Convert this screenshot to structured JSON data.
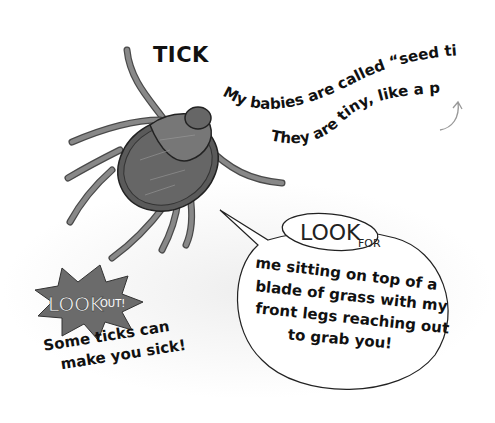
{
  "title": "TICK",
  "fact": {
    "line1": "My babies are called “seed ticks.”",
    "line2": "They are tiny, like a period."
  },
  "look_for": {
    "badge_look": "LOOK",
    "badge_for": "FOR",
    "lines": [
      "me sitting on top of a",
      "blade of grass with my",
      "front legs reaching out",
      "to grab you!"
    ]
  },
  "look_out": {
    "badge_look": "LOOK",
    "badge_out": "OUT!",
    "lines": [
      "Some ticks can",
      "make you sick!"
    ]
  },
  "colors": {
    "tick_body": "#5a5a5a",
    "tick_shield": "#6e6e6e",
    "tick_legs": "#7a7a7a",
    "starburst": "#6b6b6b",
    "ink": "#111111"
  }
}
